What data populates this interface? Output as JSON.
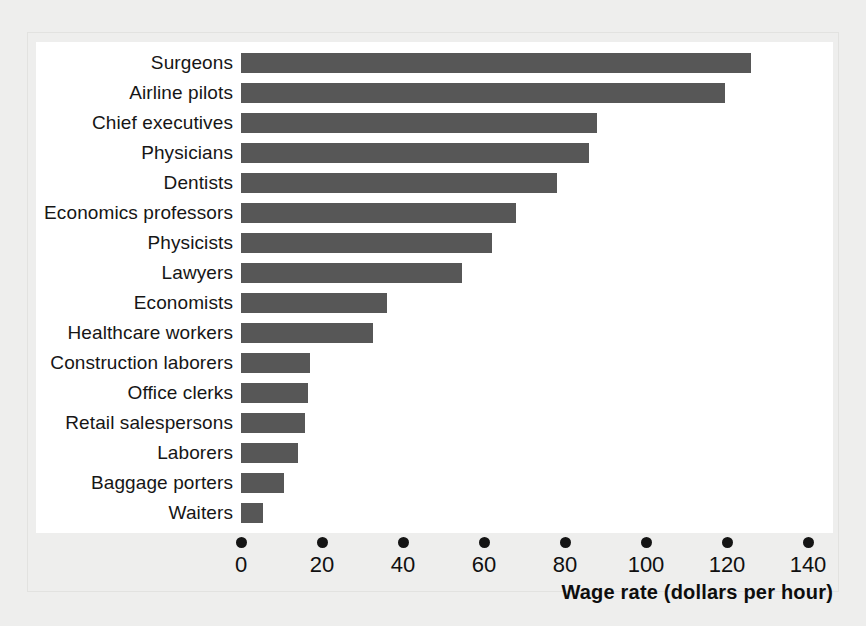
{
  "chart_data": {
    "type": "bar",
    "orientation": "horizontal",
    "title": "",
    "xlabel": "Wage rate (dollars per hour)",
    "ylabel": "",
    "xlim": [
      0,
      145
    ],
    "xticks": [
      0,
      20,
      40,
      60,
      80,
      100,
      120,
      140
    ],
    "xtick_labels": [
      "0",
      "20",
      "40",
      "60",
      "80",
      "100",
      "120",
      "140"
    ],
    "grid": false,
    "legend": false,
    "bar_color": "#575757",
    "panel_color": "#ffffff",
    "background_color": "#eeeeed",
    "categories": [
      "Surgeons",
      "Airline pilots",
      "Chief executives",
      "Physicians",
      "Dentists",
      "Economics professors",
      "Physicists",
      "Lawyers",
      "Economists",
      "Healthcare workers",
      "Construction laborers",
      "Office clerks",
      "Retail salespersons",
      "Laborers",
      "Baggage porters",
      "Waiters"
    ],
    "values": [
      126,
      119.5,
      88,
      86,
      78,
      68,
      62,
      54.5,
      36,
      32.5,
      17,
      16.5,
      15.8,
      14,
      10.5,
      5.5
    ]
  }
}
